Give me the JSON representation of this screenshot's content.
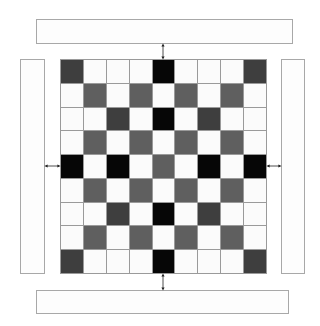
{
  "diagram": {
    "type": "grid-with-side-panels",
    "grid_size": [
      9,
      9
    ],
    "legend_levels": {
      "W": "#fbfbfb",
      "M": "#5f5f5f",
      "D": "#3e3e3e",
      "B": "#060606"
    },
    "rows": [
      [
        "D",
        "W",
        "W",
        "W",
        "B",
        "W",
        "W",
        "W",
        "D"
      ],
      [
        "W",
        "M",
        "W",
        "M",
        "W",
        "M",
        "W",
        "M",
        "W"
      ],
      [
        "W",
        "W",
        "D",
        "W",
        "B",
        "W",
        "D",
        "W",
        "W"
      ],
      [
        "W",
        "M",
        "W",
        "M",
        "W",
        "M",
        "W",
        "M",
        "W"
      ],
      [
        "B",
        "W",
        "B",
        "W",
        "M",
        "W",
        "B",
        "W",
        "B"
      ],
      [
        "W",
        "M",
        "W",
        "M",
        "W",
        "M",
        "W",
        "M",
        "W"
      ],
      [
        "W",
        "W",
        "D",
        "W",
        "B",
        "W",
        "D",
        "W",
        "W"
      ],
      [
        "W",
        "M",
        "W",
        "M",
        "W",
        "M",
        "W",
        "M",
        "W"
      ],
      [
        "D",
        "W",
        "W",
        "W",
        "B",
        "W",
        "W",
        "W",
        "D"
      ]
    ],
    "panels": {
      "top": {
        "label": ""
      },
      "bottom": {
        "label": ""
      },
      "left": {
        "label": ""
      },
      "right": {
        "label": ""
      }
    },
    "connectors": [
      "top-panel-to-grid",
      "bottom-panel-to-grid",
      "left-panel-to-grid",
      "right-panel-to-grid"
    ]
  }
}
